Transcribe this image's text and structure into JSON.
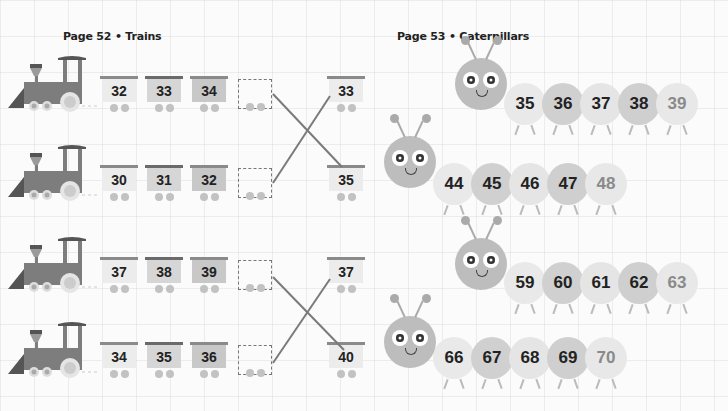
{
  "page52": {
    "title": "Page 52 • Trains",
    "trains": [
      {
        "cars": [
          "32",
          "33",
          "34"
        ],
        "answer_car": "33"
      },
      {
        "cars": [
          "30",
          "31",
          "32"
        ],
        "answer_car": "35"
      },
      {
        "cars": [
          "37",
          "38",
          "39"
        ],
        "answer_car": "37"
      },
      {
        "cars": [
          "34",
          "35",
          "36"
        ],
        "answer_car": "40"
      }
    ]
  },
  "page53": {
    "title": "Page 53 • Caterpillars",
    "caterpillars": [
      {
        "segments": [
          "35",
          "36",
          "37",
          "38",
          "39"
        ]
      },
      {
        "segments": [
          "44",
          "45",
          "46",
          "47",
          "48"
        ]
      },
      {
        "segments": [
          "59",
          "60",
          "61",
          "62",
          "63"
        ]
      },
      {
        "segments": [
          "66",
          "67",
          "68",
          "69",
          "70"
        ]
      }
    ]
  },
  "colors": {
    "loco": "#7d7d7d",
    "loco_dark": "#555555",
    "car_light": "#ececec",
    "car_mid": "#d2d2d2",
    "car_dark": "#bdbdbd",
    "line": "#7a7a7a"
  }
}
